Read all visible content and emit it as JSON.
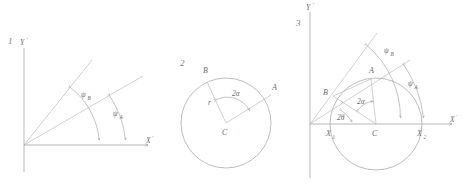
{
  "figure": {
    "title_implied": "Three-panel geometric construction of inscribed and central angles",
    "stroke_color": "#9a9a9a",
    "label_color": "#6b6b6b",
    "background": "#ffffff"
  },
  "panels": [
    {
      "number": "1",
      "description": "Two rays from origin with arc-marked angles to the X axis",
      "axes": {
        "x_label": "X",
        "x_prime": "'",
        "y_label": "Y",
        "y_prime": "'"
      },
      "angles": [
        {
          "symbol": "ψ",
          "subscript": "B",
          "name": "psi-B"
        },
        {
          "symbol": "ψ",
          "subscript": "A",
          "name": "psi-A"
        }
      ]
    },
    {
      "number": "2",
      "description": "Circle with centre C, chord endpoints A and B, radius r, central angle 2 alpha",
      "points": [
        {
          "label": "A",
          "name": "point-a"
        },
        {
          "label": "B",
          "name": "point-b"
        },
        {
          "label": "C",
          "name": "point-c-centre"
        }
      ],
      "segments": [
        {
          "label": "r",
          "name": "radius-r"
        }
      ],
      "angles": [
        {
          "symbol": "2α",
          "name": "angle-2alpha"
        }
      ]
    },
    {
      "number": "3",
      "description": "Circle crossing the X axis at X1 and X2 with centre C, points A and B, central angles 2 alpha and 2 theta, and inscribed angles psi A and psi B measured from the X axis",
      "axes": {
        "x_label": "X",
        "x_prime": "'",
        "y_label": "Y",
        "y_prime": "'"
      },
      "points": [
        {
          "label": "A",
          "name": "point-a"
        },
        {
          "label": "B",
          "name": "point-b"
        },
        {
          "label": "C",
          "name": "point-c-centre"
        }
      ],
      "axis_intercepts": [
        {
          "symbol": "X",
          "subscript": "1",
          "name": "intercept-x1"
        },
        {
          "symbol": "X",
          "subscript": "2",
          "name": "intercept-x2"
        }
      ],
      "angles": [
        {
          "symbol": "2α",
          "name": "angle-2alpha"
        },
        {
          "symbol": "2θ",
          "name": "angle-2theta"
        },
        {
          "symbol": "ψ",
          "subscript": "B",
          "name": "psi-B"
        },
        {
          "symbol": "ψ",
          "subscript": "A",
          "name": "psi-A"
        }
      ]
    }
  ]
}
